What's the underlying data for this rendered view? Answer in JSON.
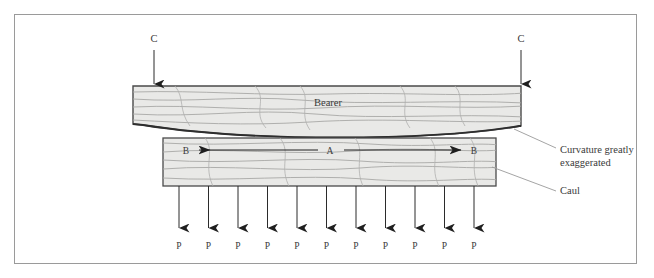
{
  "figure": {
    "frame": {
      "x": 14,
      "y": 14,
      "width": 623,
      "height": 250,
      "stroke": "#9a9a9a"
    },
    "colors": {
      "wood_fill": "#e9e9e7",
      "wood_stroke": "#4a4a4a",
      "grain": "#9b9b9b",
      "arrow": "#2b2b2b",
      "text": "#3a3a3a",
      "frame": "#9a9a9a",
      "background": "#ffffff"
    }
  },
  "bearer": {
    "label": "Bearer",
    "label_x": 328,
    "label_y": 106,
    "top_y": 86,
    "left_x": 133,
    "right_x": 521,
    "description": "Curved wooden bearer beam, convex bottom edge"
  },
  "caul": {
    "label": "Caul",
    "callout_label": "Caul",
    "callout_x": 533,
    "callout_y": 188,
    "x": 163,
    "y": 138,
    "width": 333,
    "height": 48
  },
  "annotations": [
    {
      "name": "curvature-note",
      "line1": "Curvature greatly",
      "line2": "exaggerated",
      "x": 530,
      "y": 152
    }
  ],
  "clamp_arrows": {
    "label": "C",
    "items": [
      {
        "label": "C",
        "x": 154,
        "label_y": 41,
        "line_top": 48,
        "line_bottom": 84
      },
      {
        "label": "C",
        "x": 521,
        "label_y": 41,
        "line_top": 48,
        "line_bottom": 84
      }
    ]
  },
  "internal_arrows": {
    "left": {
      "from_label": "A",
      "to_label": "B",
      "direction": "left"
    },
    "right": {
      "from_label": "A",
      "to_label": "B",
      "direction": "right"
    },
    "center_label": "A",
    "left_label": "B",
    "right_label": "B",
    "y": 150,
    "left_b_x": 186,
    "right_b_x": 474,
    "center_a_x": 330
  },
  "pressure_arrows": {
    "label": "P",
    "count": 11,
    "first_x": 179,
    "spacing": 29.5,
    "line_top": 186,
    "line_bottom": 228,
    "label_y": 248,
    "labels": [
      "P",
      "P",
      "P",
      "P",
      "P",
      "P",
      "P",
      "P",
      "P",
      "P",
      "P"
    ]
  }
}
